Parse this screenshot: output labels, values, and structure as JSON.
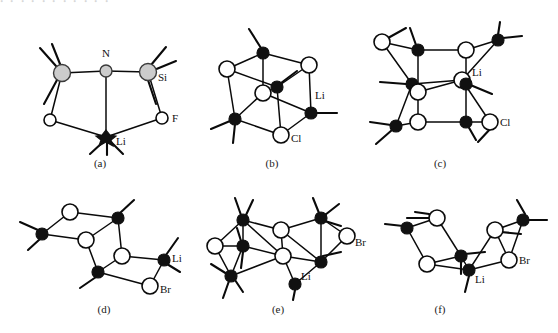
{
  "figure": {
    "top_cut_text": "ꞏ ꞏ ꞏ ꞏ  ꞏ ꞏ ꞏ ꞏ ꞏ   ꞏ ꞏ",
    "width": 558,
    "height": 333,
    "background_color": "#ffffff",
    "line_color": "#0a0a0a",
    "open_atom_fill": "#ffffff",
    "filled_atom_fill": "#111111",
    "gray_atom_fill": "#cccccc"
  },
  "panels": [
    {
      "id": "a",
      "caption": "(a)",
      "description": "five-membered Li-N-Si-F ring chelate",
      "atom_labels": [
        {
          "text": "N",
          "kind": "gray-small"
        },
        {
          "text": "Si",
          "kind": "gray-large"
        },
        {
          "text": "F",
          "kind": "open"
        },
        {
          "text": "Li",
          "kind": "filled"
        }
      ]
    },
    {
      "id": "b",
      "caption": "(b)",
      "description": "Li4Cl4 heterocubane cluster",
      "atom_labels": [
        {
          "text": "Li",
          "kind": "filled"
        },
        {
          "text": "Cl",
          "kind": "open"
        }
      ]
    },
    {
      "id": "c",
      "caption": "(c)",
      "description": "Li6Cl6 hexagonal prismatic cage",
      "atom_labels": [
        {
          "text": "Li",
          "kind": "filled"
        },
        {
          "text": "Cl",
          "kind": "open"
        }
      ]
    },
    {
      "id": "d",
      "caption": "(d)",
      "description": "Li3Br3 stepped ladder of fused rhombi",
      "atom_labels": [
        {
          "text": "Li",
          "kind": "filled"
        },
        {
          "text": "Br",
          "kind": "open"
        }
      ]
    },
    {
      "id": "e",
      "caption": "(e)",
      "description": "extended LiBr ladder stack",
      "atom_labels": [
        {
          "text": "Li",
          "kind": "filled"
        },
        {
          "text": "Br",
          "kind": "open"
        }
      ]
    },
    {
      "id": "f",
      "caption": "(f)",
      "description": "two rhombic LiBr units joined in V shape",
      "atom_labels": [
        {
          "text": "Li",
          "kind": "filled"
        },
        {
          "text": "Br",
          "kind": "open"
        }
      ]
    }
  ],
  "legend_keys": {
    "filled_circle_means": "Li",
    "open_circle_means": "halide / Cl / Br / F",
    "gray_large_circle_means": "Si",
    "gray_small_circle_means": "N"
  }
}
